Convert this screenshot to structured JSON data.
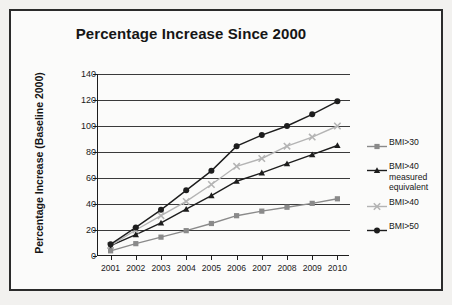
{
  "chart_data": {
    "type": "line",
    "title": "Percentage Increase Since 2000",
    "xlabel": "",
    "ylabel": "Percentage Increase (Baseline 2000)",
    "categories": [
      "2001",
      "2002",
      "2003",
      "2004",
      "2005",
      "2006",
      "2007",
      "2008",
      "2009",
      "2010"
    ],
    "x": [
      2001,
      2002,
      2003,
      2004,
      2005,
      2006,
      2007,
      2008,
      2009,
      2010
    ],
    "ylim": [
      0,
      140
    ],
    "ytick_labels": [
      "0",
      "20",
      "40",
      "60",
      "80",
      "100",
      "120",
      "140"
    ],
    "ytick_values": [
      0,
      20,
      40,
      60,
      80,
      100,
      120,
      140
    ],
    "grid": true,
    "legend_position": "right",
    "series": [
      {
        "name": "BMI>30",
        "marker": "square",
        "color": "#8a8a8a",
        "values": [
          4,
          9.5,
          14.5,
          19.5,
          25,
          31,
          34.5,
          37.5,
          40.5,
          44
        ]
      },
      {
        "name": "BMI>40 measured equivalent",
        "marker": "triangle",
        "color": "#1d1d1d",
        "values": [
          8,
          16.5,
          25.5,
          36,
          46.5,
          57.5,
          64,
          71,
          78,
          85
        ]
      },
      {
        "name": "BMI>40",
        "marker": "x",
        "color": "#b4b4b4",
        "values": [
          8,
          20,
          31,
          42,
          55,
          69,
          75,
          84.5,
          91.5,
          100
        ]
      },
      {
        "name": "BMI>50",
        "marker": "circle",
        "color": "#1d1d1d",
        "values": [
          9,
          22,
          35.5,
          50.5,
          65.5,
          84.5,
          93,
          100,
          109,
          119
        ]
      }
    ]
  },
  "legend": {
    "entries": [
      {
        "label": "BMI>30"
      },
      {
        "label": "BMI>40\nmeasured\nequivalent"
      },
      {
        "label": "BMI>40"
      },
      {
        "label": "BMI>50"
      }
    ]
  }
}
